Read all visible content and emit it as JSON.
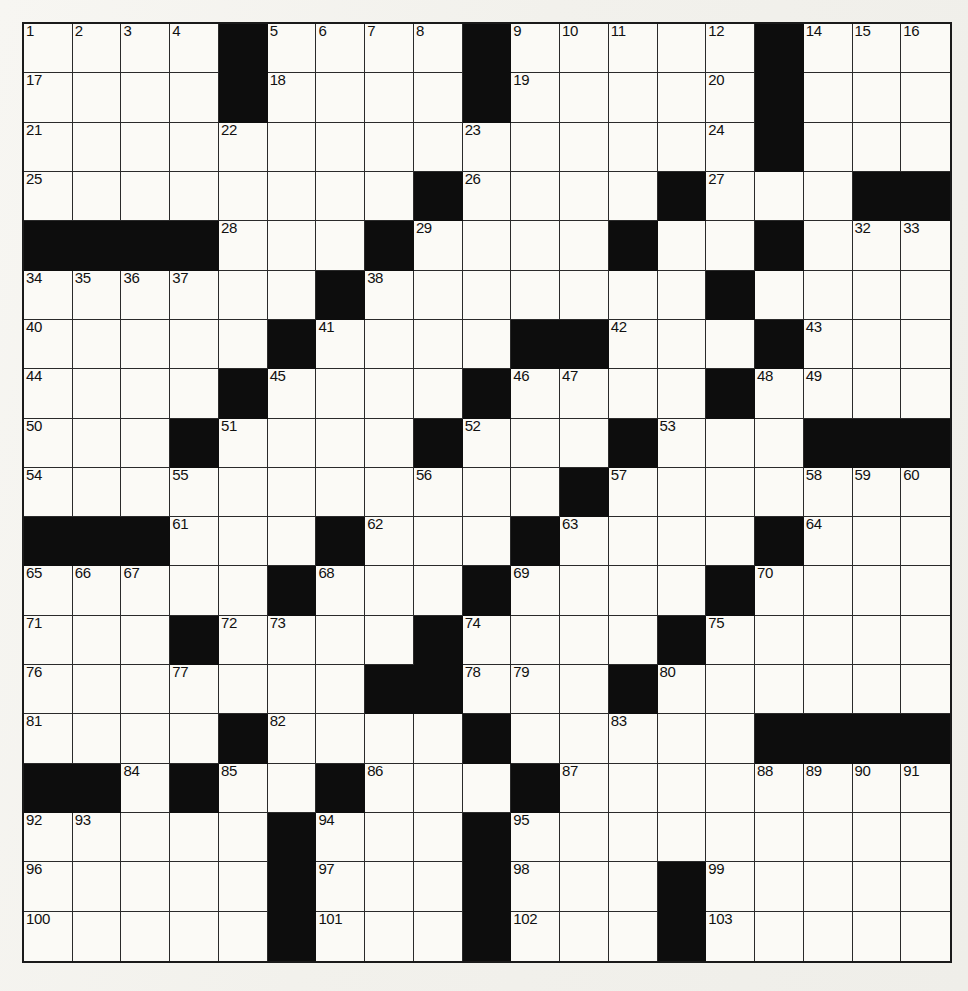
{
  "puzzle": {
    "type": "crossword-grid",
    "title": "Crossword Puzzle",
    "rows": 19,
    "cols": 19,
    "colors": {
      "paper": "#f4f3ef",
      "cell_fill": "#fbfaf6",
      "block_fill": "#0d0d0d",
      "grid_line": "#2a2a2a",
      "number_text": "#111111"
    },
    "blocks": [
      [
        0,
        4
      ],
      [
        0,
        9
      ],
      [
        0,
        15
      ],
      [
        1,
        4
      ],
      [
        1,
        9
      ],
      [
        1,
        15
      ],
      [
        2,
        15
      ],
      [
        3,
        8
      ],
      [
        3,
        13
      ],
      [
        3,
        17
      ],
      [
        3,
        18
      ],
      [
        4,
        0
      ],
      [
        4,
        1
      ],
      [
        4,
        2
      ],
      [
        4,
        3
      ],
      [
        4,
        7
      ],
      [
        4,
        12
      ],
      [
        4,
        15
      ],
      [
        5,
        6
      ],
      [
        5,
        14
      ],
      [
        6,
        5
      ],
      [
        6,
        10
      ],
      [
        6,
        11
      ],
      [
        6,
        15
      ],
      [
        7,
        4
      ],
      [
        7,
        9
      ],
      [
        7,
        14
      ],
      [
        8,
        3
      ],
      [
        8,
        8
      ],
      [
        8,
        12
      ],
      [
        8,
        16
      ],
      [
        8,
        17
      ],
      [
        8,
        18
      ],
      [
        9,
        11
      ],
      [
        10,
        0
      ],
      [
        10,
        1
      ],
      [
        10,
        2
      ],
      [
        10,
        6
      ],
      [
        10,
        10
      ],
      [
        10,
        15
      ],
      [
        11,
        5
      ],
      [
        11,
        9
      ],
      [
        11,
        14
      ],
      [
        12,
        3
      ],
      [
        12,
        8
      ],
      [
        12,
        13
      ],
      [
        13,
        7
      ],
      [
        13,
        8
      ],
      [
        13,
        12
      ],
      [
        14,
        4
      ],
      [
        14,
        9
      ],
      [
        14,
        15
      ],
      [
        14,
        16
      ],
      [
        14,
        17
      ],
      [
        14,
        18
      ],
      [
        15,
        0
      ],
      [
        15,
        1
      ],
      [
        15,
        3
      ],
      [
        15,
        6
      ],
      [
        15,
        10
      ],
      [
        16,
        5
      ],
      [
        16,
        9
      ],
      [
        17,
        5
      ],
      [
        17,
        9
      ],
      [
        17,
        13
      ],
      [
        18,
        5
      ],
      [
        18,
        9
      ],
      [
        18,
        13
      ]
    ],
    "numbers": [
      {
        "row": 0,
        "col": 0,
        "label": "1"
      },
      {
        "row": 0,
        "col": 1,
        "label": "2"
      },
      {
        "row": 0,
        "col": 2,
        "label": "3"
      },
      {
        "row": 0,
        "col": 3,
        "label": "4"
      },
      {
        "row": 0,
        "col": 5,
        "label": "5"
      },
      {
        "row": 0,
        "col": 6,
        "label": "6"
      },
      {
        "row": 0,
        "col": 7,
        "label": "7"
      },
      {
        "row": 0,
        "col": 8,
        "label": "8"
      },
      {
        "row": 0,
        "col": 10,
        "label": "9"
      },
      {
        "row": 0,
        "col": 11,
        "label": "10"
      },
      {
        "row": 0,
        "col": 12,
        "label": "11"
      },
      {
        "row": 0,
        "col": 14,
        "label": "12"
      },
      {
        "row": 0,
        "col": 15,
        "label": "13"
      },
      {
        "row": 0,
        "col": 16,
        "label": "14"
      },
      {
        "row": 0,
        "col": 17,
        "label": "15"
      },
      {
        "row": 0,
        "col": 18,
        "label": "16"
      },
      {
        "row": 1,
        "col": 0,
        "label": "17"
      },
      {
        "row": 1,
        "col": 5,
        "label": "18"
      },
      {
        "row": 1,
        "col": 10,
        "label": "19"
      },
      {
        "row": 1,
        "col": 14,
        "label": "20"
      },
      {
        "row": 2,
        "col": 0,
        "label": "21"
      },
      {
        "row": 2,
        "col": 4,
        "label": "22"
      },
      {
        "row": 2,
        "col": 9,
        "label": "23"
      },
      {
        "row": 2,
        "col": 14,
        "label": "24"
      },
      {
        "row": 3,
        "col": 0,
        "label": "25"
      },
      {
        "row": 3,
        "col": 9,
        "label": "26"
      },
      {
        "row": 3,
        "col": 14,
        "label": "27"
      },
      {
        "row": 4,
        "col": 4,
        "label": "28"
      },
      {
        "row": 4,
        "col": 8,
        "label": "29"
      },
      {
        "row": 4,
        "col": 12,
        "label": "30"
      },
      {
        "row": 4,
        "col": 15,
        "label": "31"
      },
      {
        "row": 4,
        "col": 17,
        "label": "32"
      },
      {
        "row": 4,
        "col": 18,
        "label": "33"
      },
      {
        "row": 5,
        "col": 0,
        "label": "34"
      },
      {
        "row": 5,
        "col": 1,
        "label": "35"
      },
      {
        "row": 5,
        "col": 2,
        "label": "36"
      },
      {
        "row": 5,
        "col": 3,
        "label": "37"
      },
      {
        "row": 5,
        "col": 7,
        "label": "38"
      },
      {
        "row": 5,
        "col": 14,
        "label": "39"
      },
      {
        "row": 6,
        "col": 0,
        "label": "40"
      },
      {
        "row": 6,
        "col": 6,
        "label": "41"
      },
      {
        "row": 6,
        "col": 12,
        "label": "42"
      },
      {
        "row": 6,
        "col": 16,
        "label": "43"
      },
      {
        "row": 7,
        "col": 0,
        "label": "44"
      },
      {
        "row": 7,
        "col": 5,
        "label": "45"
      },
      {
        "row": 7,
        "col": 10,
        "label": "46"
      },
      {
        "row": 7,
        "col": 11,
        "label": "47"
      },
      {
        "row": 7,
        "col": 15,
        "label": "48"
      },
      {
        "row": 7,
        "col": 16,
        "label": "49"
      },
      {
        "row": 8,
        "col": 0,
        "label": "50"
      },
      {
        "row": 8,
        "col": 4,
        "label": "51"
      },
      {
        "row": 8,
        "col": 9,
        "label": "52"
      },
      {
        "row": 8,
        "col": 13,
        "label": "53"
      },
      {
        "row": 9,
        "col": 0,
        "label": "54"
      },
      {
        "row": 9,
        "col": 3,
        "label": "55"
      },
      {
        "row": 9,
        "col": 8,
        "label": "56"
      },
      {
        "row": 9,
        "col": 12,
        "label": "57"
      },
      {
        "row": 9,
        "col": 16,
        "label": "58"
      },
      {
        "row": 9,
        "col": 17,
        "label": "59"
      },
      {
        "row": 9,
        "col": 18,
        "label": "60"
      },
      {
        "row": 10,
        "col": 3,
        "label": "61"
      },
      {
        "row": 10,
        "col": 7,
        "label": "62"
      },
      {
        "row": 10,
        "col": 11,
        "label": "63"
      },
      {
        "row": 10,
        "col": 16,
        "label": "64"
      },
      {
        "row": 11,
        "col": 0,
        "label": "65"
      },
      {
        "row": 11,
        "col": 1,
        "label": "66"
      },
      {
        "row": 11,
        "col": 2,
        "label": "67"
      },
      {
        "row": 11,
        "col": 6,
        "label": "68"
      },
      {
        "row": 11,
        "col": 10,
        "label": "69"
      },
      {
        "row": 11,
        "col": 15,
        "label": "70"
      },
      {
        "row": 12,
        "col": 0,
        "label": "71"
      },
      {
        "row": 12,
        "col": 4,
        "label": "72"
      },
      {
        "row": 12,
        "col": 5,
        "label": "73"
      },
      {
        "row": 12,
        "col": 9,
        "label": "74"
      },
      {
        "row": 12,
        "col": 14,
        "label": "75"
      },
      {
        "row": 13,
        "col": 0,
        "label": "76"
      },
      {
        "row": 13,
        "col": 3,
        "label": "77"
      },
      {
        "row": 13,
        "col": 9,
        "label": "78"
      },
      {
        "row": 13,
        "col": 10,
        "label": "79"
      },
      {
        "row": 13,
        "col": 13,
        "label": "80"
      },
      {
        "row": 14,
        "col": 0,
        "label": "81"
      },
      {
        "row": 14,
        "col": 5,
        "label": "82"
      },
      {
        "row": 14,
        "col": 12,
        "label": "83"
      },
      {
        "row": 15,
        "col": 2,
        "label": "84"
      },
      {
        "row": 15,
        "col": 4,
        "label": "85"
      },
      {
        "row": 15,
        "col": 7,
        "label": "86"
      },
      {
        "row": 15,
        "col": 11,
        "label": "87"
      },
      {
        "row": 15,
        "col": 15,
        "label": "88"
      },
      {
        "row": 15,
        "col": 16,
        "label": "89"
      },
      {
        "row": 15,
        "col": 17,
        "label": "90"
      },
      {
        "row": 15,
        "col": 18,
        "label": "91"
      },
      {
        "row": 16,
        "col": 0,
        "label": "92"
      },
      {
        "row": 16,
        "col": 1,
        "label": "93"
      },
      {
        "row": 16,
        "col": 6,
        "label": "94"
      },
      {
        "row": 16,
        "col": 10,
        "label": "95"
      },
      {
        "row": 17,
        "col": 0,
        "label": "96"
      },
      {
        "row": 17,
        "col": 6,
        "label": "97"
      },
      {
        "row": 17,
        "col": 10,
        "label": "98"
      },
      {
        "row": 17,
        "col": 14,
        "label": "99"
      },
      {
        "row": 18,
        "col": 0,
        "label": "100"
      },
      {
        "row": 18,
        "col": 6,
        "label": "101"
      },
      {
        "row": 18,
        "col": 10,
        "label": "102"
      },
      {
        "row": 18,
        "col": 14,
        "label": "103"
      }
    ]
  }
}
